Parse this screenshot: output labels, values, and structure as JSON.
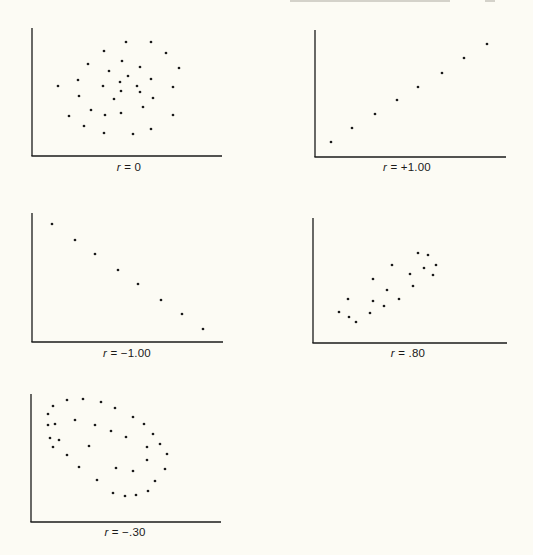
{
  "page": {
    "header_fragment": "(header text cut off at top edge)",
    "background": "#fcfbf4",
    "ink": "#1a1a1a"
  },
  "chart_data": [
    {
      "type": "scatter",
      "title": "",
      "label": "r = 0",
      "label_var": "r",
      "label_value": "= 0",
      "correlation": 0,
      "xlabel": "",
      "ylabel": "",
      "grid": false,
      "axes_px": {
        "x0": 32,
        "y_top": 28,
        "y_axis": 156,
        "x_end": 222
      },
      "label_px": {
        "x": 129,
        "y": 167
      },
      "points": [
        [
          126,
          42
        ],
        [
          151,
          42
        ],
        [
          104,
          51
        ],
        [
          166,
          53
        ],
        [
          88,
          64
        ],
        [
          122,
          61
        ],
        [
          140,
          67
        ],
        [
          179,
          68
        ],
        [
          109,
          71
        ],
        [
          128,
          76
        ],
        [
          78,
          80
        ],
        [
          120,
          82
        ],
        [
          151,
          79
        ],
        [
          58,
          86
        ],
        [
          103,
          86
        ],
        [
          137,
          86
        ],
        [
          173,
          87
        ],
        [
          121,
          91
        ],
        [
          140,
          92
        ],
        [
          79,
          96
        ],
        [
          153,
          98
        ],
        [
          114,
          99
        ],
        [
          143,
          107
        ],
        [
          91,
          110
        ],
        [
          121,
          113
        ],
        [
          69,
          116
        ],
        [
          105,
          115
        ],
        [
          173,
          115
        ],
        [
          84,
          126
        ],
        [
          151,
          129
        ],
        [
          104,
          133
        ],
        [
          133,
          134
        ]
      ]
    },
    {
      "type": "scatter",
      "title": "",
      "label": "r = +1.00",
      "label_var": "r",
      "label_value": "=  +1.00",
      "correlation": 1.0,
      "xlabel": "",
      "ylabel": "",
      "grid": false,
      "axes_px": {
        "x0": 315,
        "y_top": 30,
        "y_axis": 157,
        "x_end": 506
      },
      "label_px": {
        "x": 407,
        "y": 167
      },
      "points": [
        [
          331,
          142
        ],
        [
          352,
          128
        ],
        [
          375,
          114
        ],
        [
          397,
          100
        ],
        [
          418,
          87
        ],
        [
          442,
          73
        ],
        [
          464,
          58
        ],
        [
          487,
          44
        ]
      ]
    },
    {
      "type": "scatter",
      "title": "",
      "label": "r = -1.00",
      "label_var": "r",
      "label_value": "=  −1.00",
      "correlation": -1.0,
      "xlabel": "",
      "ylabel": "",
      "grid": false,
      "axes_px": {
        "x0": 32,
        "y_top": 213,
        "y_axis": 342,
        "x_end": 223
      },
      "label_px": {
        "x": 127,
        "y": 353
      },
      "points": [
        [
          52,
          224
        ],
        [
          75,
          240
        ],
        [
          95,
          254
        ],
        [
          118,
          270
        ],
        [
          138,
          284
        ],
        [
          161,
          300
        ],
        [
          182,
          314
        ],
        [
          203,
          329
        ]
      ]
    },
    {
      "type": "scatter",
      "title": "",
      "label": "r = .80",
      "label_var": "r",
      "label_value": "=  .80",
      "correlation": 0.8,
      "xlabel": "",
      "ylabel": "",
      "grid": false,
      "axes_px": {
        "x0": 313,
        "y_top": 218,
        "y_axis": 343,
        "x_end": 507
      },
      "label_px": {
        "x": 408,
        "y": 353
      },
      "points": [
        [
          418,
          253
        ],
        [
          428,
          255
        ],
        [
          392,
          265
        ],
        [
          436,
          265
        ],
        [
          424,
          268
        ],
        [
          410,
          274
        ],
        [
          433,
          275
        ],
        [
          373,
          279
        ],
        [
          413,
          286
        ],
        [
          387,
          290
        ],
        [
          348,
          299
        ],
        [
          399,
          299
        ],
        [
          373,
          301
        ],
        [
          384,
          306
        ],
        [
          339,
          312
        ],
        [
          370,
          313
        ],
        [
          349,
          317
        ],
        [
          356,
          322
        ]
      ]
    },
    {
      "type": "scatter",
      "title": "",
      "label": "r = -.30",
      "label_var": "r",
      "label_value": "=  −.30",
      "correlation": -0.3,
      "xlabel": "",
      "ylabel": "",
      "grid": false,
      "axes_px": {
        "x0": 31,
        "y_top": 394,
        "y_axis": 522,
        "x_end": 221
      },
      "label_px": {
        "x": 125,
        "y": 532
      },
      "points": [
        [
          67,
          400
        ],
        [
          83,
          399
        ],
        [
          53,
          406
        ],
        [
          101,
          402
        ],
        [
          115,
          408
        ],
        [
          48,
          414
        ],
        [
          133,
          417
        ],
        [
          75,
          420
        ],
        [
          48,
          425
        ],
        [
          55,
          424
        ],
        [
          95,
          425
        ],
        [
          144,
          424
        ],
        [
          111,
          431
        ],
        [
          153,
          434
        ],
        [
          50,
          438
        ],
        [
          59,
          440
        ],
        [
          126,
          437
        ],
        [
          160,
          444
        ],
        [
          53,
          447
        ],
        [
          89,
          446
        ],
        [
          147,
          447
        ],
        [
          167,
          454
        ],
        [
          67,
          455
        ],
        [
          147,
          460
        ],
        [
          79,
          467
        ],
        [
          116,
          468
        ],
        [
          133,
          471
        ],
        [
          165,
          469
        ],
        [
          97,
          480
        ],
        [
          155,
          481
        ],
        [
          113,
          493
        ],
        [
          148,
          491
        ],
        [
          125,
          496
        ],
        [
          136,
          495
        ]
      ]
    }
  ]
}
